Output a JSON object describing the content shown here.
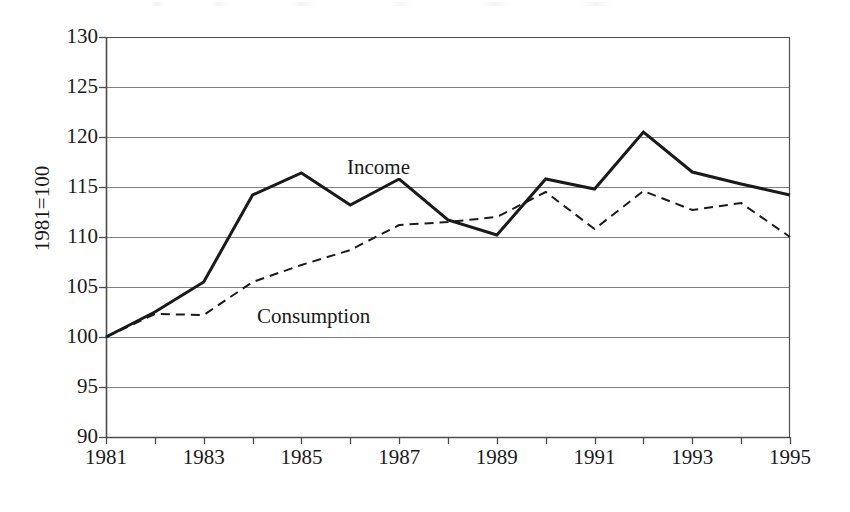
{
  "figure": {
    "background_color": "#ffffff",
    "ink_color": "#1a1a1a",
    "gridline_color": "#808080",
    "axis_color": "#4d4d4d"
  },
  "axes": {
    "ylabel": "1981=100",
    "yticks": [
      "130",
      "125",
      "120",
      "115",
      "110",
      "105",
      "100",
      "95",
      "90"
    ],
    "xticks": [
      "1981",
      "1983",
      "1985",
      "1987",
      "1989",
      "1991",
      "1993",
      "1995"
    ]
  },
  "annotations": {
    "income": "Income",
    "consumption": "Consumption"
  },
  "chart_data": {
    "type": "line",
    "title": "",
    "subtitle": "",
    "xlabel": "",
    "ylabel": "1981=100",
    "x": [
      1981,
      1982,
      1983,
      1984,
      1985,
      1986,
      1987,
      1988,
      1989,
      1990,
      1991,
      1992,
      1993,
      1994,
      1995
    ],
    "xlim": [
      1981,
      1995
    ],
    "ylim": [
      90,
      130
    ],
    "ytick_values": [
      90,
      95,
      100,
      105,
      110,
      115,
      120,
      125,
      130
    ],
    "xtick_values": [
      1981,
      1982,
      1983,
      1984,
      1985,
      1986,
      1987,
      1988,
      1989,
      1990,
      1991,
      1992,
      1993,
      1994,
      1995
    ],
    "xtick_labels_shown": [
      1981,
      1983,
      1985,
      1987,
      1989,
      1991,
      1993,
      1995
    ],
    "grid": "horizontal",
    "legend": "inline-annotations",
    "series": [
      {
        "name": "Income",
        "style": "solid",
        "linewidth": 3,
        "color": "#1a1a1a",
        "values": [
          100.0,
          102.5,
          105.5,
          114.2,
          116.4,
          113.2,
          115.8,
          111.7,
          110.2,
          115.8,
          114.8,
          120.5,
          116.5,
          115.3,
          114.2
        ]
      },
      {
        "name": "Consumption",
        "style": "dashed",
        "linewidth": 2,
        "color": "#1a1a1a",
        "values": [
          100.0,
          102.3,
          102.2,
          105.5,
          107.2,
          108.7,
          111.2,
          111.5,
          112.0,
          114.5,
          110.8,
          114.6,
          112.7,
          113.4,
          110.0
        ]
      }
    ]
  },
  "plot_geometry": {
    "left": 106,
    "right": 790,
    "top": 37,
    "bottom": 437
  }
}
